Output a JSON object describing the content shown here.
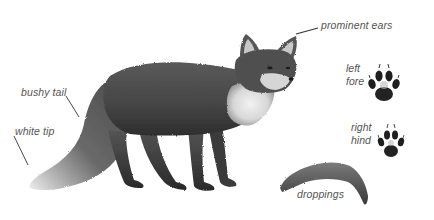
{
  "illustration": {
    "subject": "fox",
    "colors": {
      "background": "#ffffff",
      "fur_dark": "#3a3a3a",
      "fur_mid": "#5e5e5e",
      "fur_light": "#9a9a9a",
      "white_fur": "#e8e8e8",
      "label_text": "#555555",
      "leader_line": "#333333"
    }
  },
  "labels": {
    "prominent_ears": "prominent ears",
    "bushy_tail": "bushy tail",
    "white_tip": "white tip",
    "left_fore": [
      "left",
      "fore"
    ],
    "right_hind": [
      "right",
      "hind"
    ],
    "droppings": "droppings"
  },
  "icons": {
    "left_fore_paw": "paw-print-icon",
    "right_hind_paw": "paw-print-icon",
    "droppings": "droppings-icon"
  }
}
